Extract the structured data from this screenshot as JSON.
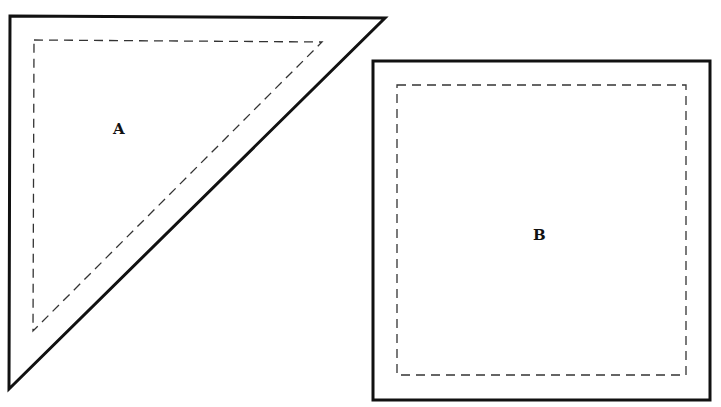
{
  "pieces": [
    {
      "id": "A",
      "shape": "right-triangle",
      "label": "A",
      "cutting_line": "solid",
      "seam_line": "dashed"
    },
    {
      "id": "B",
      "shape": "square",
      "label": "B",
      "cutting_line": "solid",
      "seam_line": "dashed"
    }
  ],
  "colors": {
    "line": "#111111",
    "seam": "#333333",
    "background": "#ffffff"
  }
}
